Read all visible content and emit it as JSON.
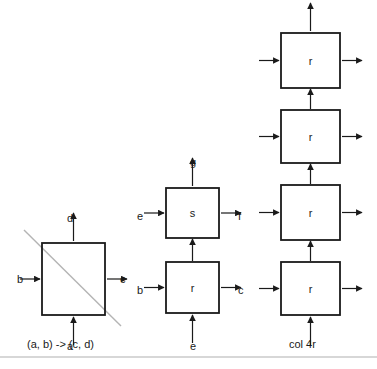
{
  "figure": {
    "background_color": "#ffffff",
    "stroke_color": "#1a1a1a",
    "diagonal_color": "#b4b4b4",
    "divider_color": "#b0b0b0"
  },
  "groups": [
    {
      "id": "left",
      "caption": "(a, b) -> (c, d)",
      "has_diagonal": true,
      "boxes": [
        {
          "id": "left-box",
          "label": "",
          "x": 42,
          "y": 243,
          "w": 63,
          "h": 72,
          "ports": [
            {
              "side": "left",
              "label": "b"
            },
            {
              "side": "right",
              "label": "c"
            },
            {
              "side": "top",
              "label": "d"
            },
            {
              "side": "bottom",
              "label": "a"
            }
          ]
        }
      ]
    },
    {
      "id": "middle",
      "caption": "",
      "has_diagonal": false,
      "boxes": [
        {
          "id": "middle-box-s",
          "label": "s",
          "x": 166,
          "y": 188,
          "w": 53,
          "h": 50,
          "ports": [
            {
              "side": "left",
              "label": "e"
            },
            {
              "side": "right",
              "label": "f"
            },
            {
              "side": "top",
              "label": "g"
            }
          ]
        },
        {
          "id": "middle-box-r",
          "label": "r",
          "x": 166,
          "y": 262,
          "w": 53,
          "h": 51,
          "ports": [
            {
              "side": "left",
              "label": "b"
            },
            {
              "side": "right",
              "label": "c"
            },
            {
              "side": "bottom",
              "label": "e"
            }
          ]
        }
      ]
    },
    {
      "id": "right",
      "caption": "col 4r",
      "has_diagonal": false,
      "boxes": [
        {
          "id": "right-box-1",
          "label": "r",
          "x": 281,
          "y": 33,
          "w": 59,
          "h": 55,
          "ports": [
            {
              "side": "left",
              "label": ""
            },
            {
              "side": "right",
              "label": ""
            },
            {
              "side": "top",
              "label": ""
            }
          ]
        },
        {
          "id": "right-box-2",
          "label": "r",
          "x": 281,
          "y": 110,
          "w": 59,
          "h": 53,
          "ports": [
            {
              "side": "left",
              "label": ""
            },
            {
              "side": "right",
              "label": ""
            }
          ]
        },
        {
          "id": "right-box-3",
          "label": "r",
          "x": 281,
          "y": 185,
          "w": 59,
          "h": 55,
          "ports": [
            {
              "side": "left",
              "label": ""
            },
            {
              "side": "right",
              "label": ""
            }
          ]
        },
        {
          "id": "right-box-4",
          "label": "r",
          "x": 281,
          "y": 262,
          "w": 59,
          "h": 53,
          "ports": [
            {
              "side": "left",
              "label": ""
            },
            {
              "side": "right",
              "label": ""
            },
            {
              "side": "bottom",
              "label": ""
            }
          ]
        }
      ]
    }
  ],
  "captions": [
    {
      "id": "left-caption",
      "text": "(a, b) -> (c, d)",
      "x": 27,
      "y": 339
    },
    {
      "id": "right-caption",
      "text": "col 4r",
      "x": 289,
      "y": 339
    }
  ],
  "port_labels": [
    {
      "id": "left-d",
      "text": "d",
      "x": 67,
      "y": 213
    },
    {
      "id": "left-b",
      "text": "b",
      "x": 17,
      "y": 274
    },
    {
      "id": "left-c",
      "text": "c",
      "x": 120,
      "y": 274
    },
    {
      "id": "left-a",
      "text": "a",
      "x": 67,
      "y": 341
    },
    {
      "id": "mid-g",
      "text": "g",
      "x": 190,
      "y": 157
    },
    {
      "id": "mid-e1",
      "text": "e",
      "x": 137,
      "y": 211
    },
    {
      "id": "mid-f",
      "text": "f",
      "x": 238,
      "y": 211
    },
    {
      "id": "mid-b",
      "text": "b",
      "x": 137,
      "y": 285
    },
    {
      "id": "mid-c",
      "text": "c",
      "x": 238,
      "y": 285
    },
    {
      "id": "mid-e2",
      "text": "e",
      "x": 190,
      "y": 341
    }
  ],
  "divider": {
    "x1": 0,
    "y1": 357,
    "x2": 377,
    "y2": 357
  },
  "diagonal": {
    "x1": 24,
    "y1": 230,
    "x2": 121,
    "y2": 326
  }
}
